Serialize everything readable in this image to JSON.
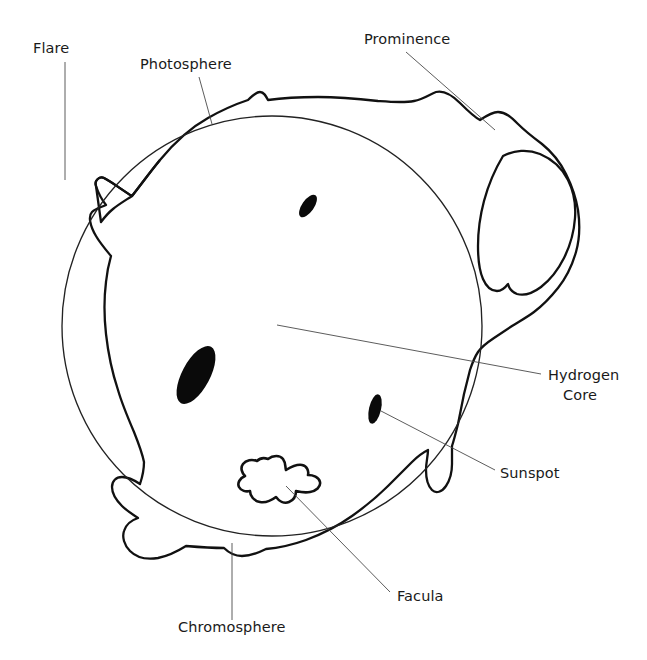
{
  "diagram": {
    "background_color": "#ffffff",
    "ink_color": "#111111",
    "leader_color": "#4a4a4a",
    "width": 647,
    "height": 660
  },
  "labels": [
    {
      "id": "flare",
      "text": "Flare",
      "x": 33,
      "y": 53,
      "anchor": "start",
      "leader": "M 65 62 L 65 180"
    },
    {
      "id": "photosphere",
      "text": "Photosphere",
      "x": 140,
      "y": 69,
      "anchor": "start",
      "leader": "M 199 77 L 212 124"
    },
    {
      "id": "prominence",
      "text": "Prominence",
      "x": 364,
      "y": 44,
      "anchor": "start",
      "leader": "M 406 52 L 495 130"
    },
    {
      "id": "hydrogen-core",
      "text": "Hydrogen",
      "text2": "Core",
      "x": 548,
      "y": 380,
      "y2": 400,
      "anchor": "start",
      "leader": "M 277 325 L 541 374"
    },
    {
      "id": "sunspot",
      "text": "Sunspot",
      "x": 500,
      "y": 478,
      "anchor": "start",
      "leader": "M 381 411 L 495 470"
    },
    {
      "id": "facula",
      "text": "Facula",
      "x": 397,
      "y": 601,
      "anchor": "start",
      "leader": "M 286 486 L 390 592"
    },
    {
      "id": "chromosphere",
      "text": "Chromosphere",
      "x": 178,
      "y": 632,
      "anchor": "start",
      "leader": "M 232 543 L 232 620"
    }
  ],
  "features": {
    "photosphere": {
      "name": "photosphere",
      "shape": "circle",
      "cx": 272,
      "cy": 326,
      "r": 210
    },
    "chromosphere": {
      "name": "chromosphere",
      "shape": "wavy-outline"
    },
    "prominence": {
      "name": "prominence",
      "shape": "loop-arch"
    },
    "flare": {
      "name": "flare",
      "shape": "spike"
    },
    "facula": {
      "name": "facula",
      "shape": "irregular-blob",
      "cx": 276,
      "cy": 482
    },
    "sunspots": [
      {
        "name": "sunspot-upper",
        "cx": 308,
        "cy": 206,
        "rx": 6,
        "ry": 13,
        "angle": 35
      },
      {
        "name": "sunspot-large",
        "cx": 196,
        "cy": 375,
        "rx": 14,
        "ry": 32,
        "angle": 28
      },
      {
        "name": "sunspot-lower",
        "cx": 375,
        "cy": 409,
        "rx": 6,
        "ry": 15,
        "angle": 13
      }
    ]
  }
}
